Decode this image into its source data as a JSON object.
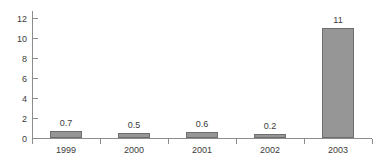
{
  "chart_data": {
    "type": "bar",
    "title": "",
    "subtitle": "",
    "xlabel": "",
    "ylabel": "",
    "categories": [
      "1999",
      "2000",
      "2001",
      "2002",
      "2003"
    ],
    "values": [
      0.7,
      0.5,
      0.6,
      0.2,
      11
    ],
    "value_labels": [
      "0.7",
      "0.5",
      "0.6",
      "0.2",
      "11"
    ],
    "ylim": [
      0,
      12
    ],
    "y_ticks": [
      0,
      2,
      4,
      6,
      8,
      10,
      12
    ],
    "y_tick_labels": [
      "0",
      "2",
      "4",
      "6",
      "8",
      "10",
      "12"
    ],
    "grid": false,
    "legend": false,
    "legend_position": "none",
    "series": [
      {
        "name": "",
        "values": [
          0.7,
          0.5,
          0.6,
          0.2,
          11
        ]
      }
    ],
    "colors": {
      "bar_fill": "#969696",
      "bar_border": "#6e6e6e",
      "axis": "#8c8c8c",
      "text": "#3c3c3c",
      "background": "#ffffff"
    }
  }
}
